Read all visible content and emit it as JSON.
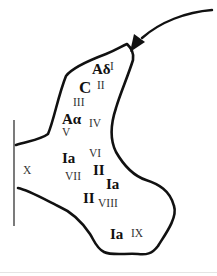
{
  "diagram": {
    "type": "spinal-cord-lamina-diagram",
    "fibers": [
      {
        "id": "adelta",
        "label": "Aδ",
        "lamina": "I"
      },
      {
        "id": "c",
        "label": "C",
        "lamina": "II"
      },
      {
        "id": "aalpha",
        "label": "Aα",
        "lamina": "IV/V"
      },
      {
        "id": "ia-1",
        "label": "Ia",
        "lamina": "VI/VII"
      },
      {
        "id": "ii-1",
        "label": "II",
        "lamina": "VII"
      },
      {
        "id": "ia-2",
        "label": "Ia",
        "lamina": "VII"
      },
      {
        "id": "ii-2",
        "label": "II",
        "lamina": "VIII"
      },
      {
        "id": "ia-3",
        "label": "Ia",
        "lamina": "IX"
      }
    ],
    "laminae": [
      {
        "id": "I",
        "label": "I"
      },
      {
        "id": "II",
        "label": "II"
      },
      {
        "id": "III",
        "label": "III"
      },
      {
        "id": "IV",
        "label": "IV"
      },
      {
        "id": "V",
        "label": "V"
      },
      {
        "id": "VI",
        "label": "VI"
      },
      {
        "id": "VII",
        "label": "VII"
      },
      {
        "id": "VIII",
        "label": "VIII"
      },
      {
        "id": "IX",
        "label": "IX"
      },
      {
        "id": "X",
        "label": "X"
      }
    ],
    "arrow": {
      "label": "afferent input",
      "direction": "into dorsal horn"
    },
    "colors": {
      "stroke": "#111111",
      "background": "#ffffff",
      "fiber_text": "#111111",
      "lamina_text": "#333333"
    }
  }
}
